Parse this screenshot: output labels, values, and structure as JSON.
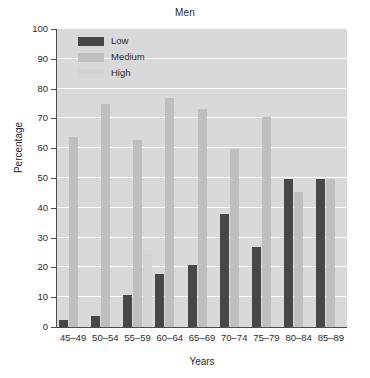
{
  "chart_data": {
    "type": "bar",
    "title": "Men",
    "xlabel": "Years",
    "ylabel": "Percentage",
    "ylim": [
      0,
      100
    ],
    "yticks": [
      0,
      10,
      20,
      30,
      40,
      50,
      60,
      70,
      80,
      90,
      100
    ],
    "grid": true,
    "legend_position": "upper-left-inside",
    "categories": [
      "45–49",
      "50–54",
      "55–59",
      "60–64",
      "65–69",
      "70–74",
      "75–79",
      "80–84",
      "85–89"
    ],
    "series": [
      {
        "name": "Low",
        "color": "#474747",
        "values": [
          2.5,
          3.7,
          10.8,
          17.8,
          20.8,
          38.0,
          26.8,
          49.8,
          49.7
        ]
      },
      {
        "name": "Medium",
        "color": "#bfbfbf",
        "values": [
          63.8,
          74.7,
          62.6,
          76.8,
          73.0,
          59.7,
          70.6,
          45.4,
          49.7
        ]
      },
      {
        "name": "High",
        "color": "#d4d4d4",
        "values": [
          0,
          0,
          25.8,
          0,
          0,
          0,
          0,
          0,
          0
        ]
      }
    ],
    "plot_background": "#d9d9d9",
    "gridline_color": "#ffffff",
    "axis_color": "#4d4d4d"
  }
}
